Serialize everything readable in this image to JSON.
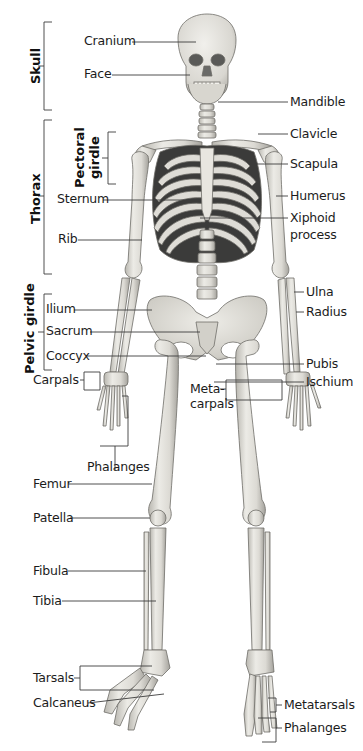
{
  "diagram": {
    "groups": [
      {
        "id": "skull",
        "label": "Skull"
      },
      {
        "id": "thorax",
        "label": "Thorax"
      },
      {
        "id": "pectoral",
        "label_line1": "Pectoral",
        "label_line2": "girdle"
      },
      {
        "id": "pelvic",
        "label": "Pelvic girdle"
      }
    ],
    "labels_left": {
      "cranium": "Cranium",
      "face": "Face",
      "sternum": "Sternum",
      "rib": "Rib",
      "ilium": "Ilium",
      "sacrum": "Sacrum",
      "coccyx": "Coccyx",
      "carpals": "Carpals",
      "phalanges_hand": "Phalanges",
      "femur": "Femur",
      "patella": "Patella",
      "fibula": "Fibula",
      "tibia": "Tibia",
      "tarsals": "Tarsals",
      "calcaneus": "Calcaneus"
    },
    "labels_right": {
      "mandible": "Mandible",
      "clavicle": "Clavicle",
      "scapula": "Scapula",
      "humerus": "Humerus",
      "xiphoid_1": "Xiphoid",
      "xiphoid_2": "process",
      "ulna": "Ulna",
      "radius": "Radius",
      "pubis": "Pubis",
      "ischium": "Ischium",
      "metacarpals_1": "Meta-",
      "metacarpals_2": "carpals",
      "metatarsals": "Metatarsals",
      "phalanges_foot": "Phalanges"
    },
    "colors": {
      "bone": "#e4e2dc",
      "bone_shadow": "#a9a7a0",
      "bone_outline": "#6f6d68",
      "rib_gap": "#3a3a3a",
      "leader": "#3c3c3c"
    }
  }
}
